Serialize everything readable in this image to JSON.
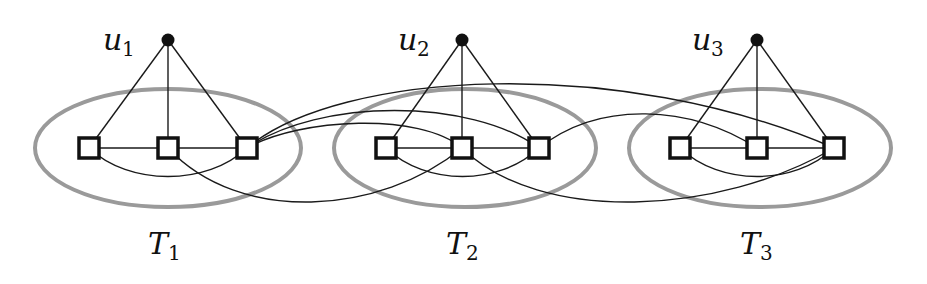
{
  "colors": {
    "edge": "#1a1a1a",
    "ellipse": "#9a9a9a",
    "node_fill": "#ffffff",
    "node_stroke": "#111111",
    "apex": "#111111"
  },
  "apex_nodes": [
    {
      "id": "u1",
      "label": "u",
      "sub": "1",
      "x": 168,
      "y": 40,
      "lx": 103,
      "ly": 50
    },
    {
      "id": "u2",
      "label": "u",
      "sub": "2",
      "x": 462,
      "y": 40,
      "lx": 398,
      "ly": 50
    },
    {
      "id": "u3",
      "label": "u",
      "sub": "3",
      "x": 757,
      "y": 40,
      "lx": 692,
      "ly": 50
    }
  ],
  "groups": [
    {
      "id": "T1",
      "label": "T",
      "sub": "1",
      "cx": 168,
      "cy": 148,
      "rx": 133,
      "ry": 59,
      "lx": 148,
      "ly": 254,
      "nodes": [
        {
          "x": 89,
          "y": 148
        },
        {
          "x": 168,
          "y": 148
        },
        {
          "x": 247,
          "y": 148
        }
      ]
    },
    {
      "id": "T2",
      "label": "T",
      "sub": "2",
      "cx": 465,
      "cy": 148,
      "rx": 131,
      "ry": 59,
      "lx": 446,
      "ly": 254,
      "nodes": [
        {
          "x": 386,
          "y": 148
        },
        {
          "x": 462,
          "y": 148
        },
        {
          "x": 539,
          "y": 148
        }
      ]
    },
    {
      "id": "T3",
      "label": "T",
      "sub": "3",
      "cx": 760,
      "cy": 148,
      "rx": 131,
      "ry": 59,
      "lx": 740,
      "ly": 254,
      "nodes": [
        {
          "x": 680,
          "y": 148
        },
        {
          "x": 757,
          "y": 148
        },
        {
          "x": 834,
          "y": 148
        }
      ]
    }
  ],
  "cross_edges": [
    {
      "from": "T1.3",
      "to": "T2.2",
      "d": "M247,148 C300,118 420,112 462,148"
    },
    {
      "from": "T1.3",
      "to": "T2.3",
      "d": "M247,148 C320,98 470,98 539,148"
    },
    {
      "from": "T1.3",
      "to": "T3.3",
      "d": "M247,148 C340,70 620,55 834,148"
    },
    {
      "from": "T1.2",
      "to": "T2.2",
      "d": "M168,148 C240,225 380,215 462,148"
    },
    {
      "from": "T2.2",
      "to": "T3.3",
      "d": "M462,148 C540,225 720,215 834,148"
    },
    {
      "from": "T2.3",
      "to": "T3.2",
      "d": "M539,148 C600,100 690,105 757,148"
    }
  ]
}
